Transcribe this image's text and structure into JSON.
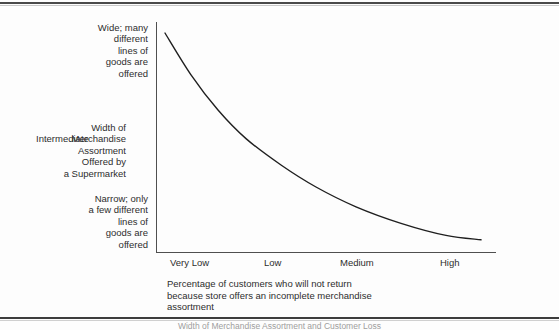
{
  "figure": {
    "background_color": "#fdfdfd",
    "ink_color": "#2d2d2d",
    "axis_color": "#4f4f4f",
    "page_rule_color": "#4a4a4a",
    "bottom_cut_text": "Width of Merchandise Assortment and Customer Loss"
  },
  "chart_data": {
    "type": "line",
    "title": "",
    "xlabel": "Percentage of customers who will not return\nbecause store offers an incomplete merchandise\nassortment",
    "ylabel": "Width of\nMerchandise\nAssortment\nOffered by\na Supermarket",
    "categories": [
      "Very Low",
      "Low",
      "Medium",
      "High"
    ],
    "x": [
      0,
      1,
      2,
      3
    ],
    "y_categories": [
      "Wide; many\ndifferent\nlines of\ngoods are\noffered",
      "Intermediate",
      "Narrow; only\na few different\nlines of\ngoods are\noffered"
    ],
    "y_category_values": [
      3,
      2,
      1
    ],
    "series": [
      {
        "name": "Assortment width vs. customer loss",
        "values": [
          3.0,
          2.05,
          1.45,
          1.12
        ],
        "curve_points": [
          [
            0.09,
            3.0
          ],
          [
            0.35,
            2.62
          ],
          [
            0.62,
            2.3
          ],
          [
            0.9,
            2.04
          ],
          [
            1.25,
            1.8
          ],
          [
            1.6,
            1.6
          ],
          [
            2.0,
            1.42
          ],
          [
            2.45,
            1.27
          ],
          [
            2.9,
            1.16
          ],
          [
            3.25,
            1.12
          ]
        ],
        "shape": "monotonically decreasing convex decay",
        "color": "#1f1f1f",
        "line_width": 1.4
      }
    ],
    "xlim": [
      0,
      3.4
    ],
    "ylim": [
      1.0,
      3.1
    ],
    "grid": false,
    "legend": false,
    "legend_position": "none",
    "annotations": []
  },
  "axis": {
    "y_label_top": "Wide; many\ndifferent\nlines of\ngoods are\noffered",
    "y_label_middle": "Intermediate",
    "y_label_bottom": "Narrow; only\na few different\nlines of\ngoods are\noffered",
    "y_axis_title": "Width of\nMerchandise\nAssortment\nOffered by\na Supermarket",
    "x_ticks": [
      {
        "label": "Very Low",
        "left": 170
      },
      {
        "label": "Low",
        "left": 264
      },
      {
        "label": "Medium",
        "left": 340
      },
      {
        "label": "High",
        "left": 440
      }
    ],
    "x_axis_title": "Percentage of customers who will not return\nbecause store offers an incomplete merchandise\nassortment"
  }
}
